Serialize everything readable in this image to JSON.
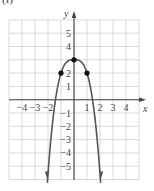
{
  "panel_label": "(f)",
  "chart_data": {
    "type": "line",
    "title": "",
    "xlabel": "x",
    "ylabel": "y",
    "xlim": [
      -5,
      5
    ],
    "ylim": [
      -6,
      6
    ],
    "grid": true,
    "x_ticks": [
      -4,
      -3,
      -2,
      1,
      2,
      3,
      4
    ],
    "x_tick_labels": [
      "−4",
      "−3",
      "−2",
      "1",
      "2",
      "3",
      "4"
    ],
    "y_ticks": [
      5,
      4,
      2,
      1,
      -1,
      -2,
      -3,
      -4,
      -5
    ],
    "y_tick_labels": [
      "5",
      "4",
      "2",
      "1",
      "−1",
      "−2",
      "−3",
      "−4",
      "−5"
    ],
    "series": [
      {
        "name": "curve",
        "description": "downward opening curve, symmetric about y-axis, arrows pointing down at both ends",
        "x": [
          -2.05,
          -1.75,
          -1.5,
          -1.25,
          -1,
          -0.5,
          0,
          0.5,
          1,
          1.25,
          1.5,
          1.75,
          2.05
        ],
        "y": [
          -5.6,
          -2.36,
          -0.38,
          1.05,
          2,
          2.88,
          3,
          2.88,
          2,
          1.05,
          -0.38,
          -2.36,
          -5.6
        ]
      }
    ],
    "marked_points": [
      {
        "x": -1,
        "y": 2
      },
      {
        "x": 0,
        "y": 3
      },
      {
        "x": 1,
        "y": 2
      }
    ],
    "colors": {
      "grid": "#cfcfcf",
      "axes": "#444444",
      "curve": "#555555",
      "points": "#111111"
    }
  }
}
